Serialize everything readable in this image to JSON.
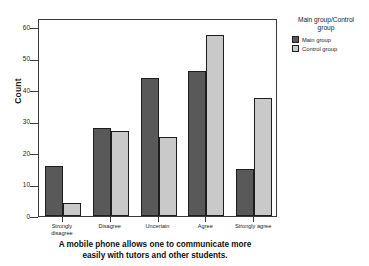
{
  "chart_data": {
    "type": "bar",
    "title": "",
    "xlabel": "A mobile phone allows one to communicate more\neasily with tutors and other students.",
    "ylabel": "Count",
    "categories": [
      "Strongly\ndisagree",
      "Disagree",
      "Uncertain",
      "Agree",
      "Strongly agree"
    ],
    "series": [
      {
        "name": "Main group",
        "color": "#595959",
        "values": [
          16,
          28,
          44,
          46,
          15
        ]
      },
      {
        "name": "Control group",
        "color": "#c9c9c9",
        "values": [
          4,
          27,
          25,
          57.5,
          37.5
        ]
      }
    ],
    "ylim": [
      0,
      63
    ],
    "yticks": [
      0,
      10,
      20,
      30,
      40,
      50,
      60
    ],
    "ytick_labels": [
      "0",
      "10",
      "20",
      "30",
      "40",
      "50",
      "60"
    ],
    "grid": false,
    "legend_position": "right",
    "legend_title": "Main group/Control\ngroup"
  }
}
